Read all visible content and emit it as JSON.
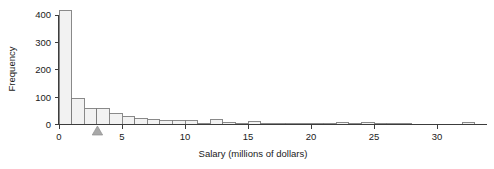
{
  "chart_data": {
    "type": "bar",
    "subtype": "histogram",
    "title": "",
    "xlabel": "Salary (millions of dollars)",
    "ylabel": "Frequency",
    "xlim": [
      0,
      33.5
    ],
    "ylim": [
      0,
      420
    ],
    "grid": false,
    "legend": null,
    "bin_width": 1,
    "x_ticks": [
      0,
      5,
      10,
      15,
      20,
      25,
      30
    ],
    "x_tick_labels": [
      "0",
      "5",
      "10",
      "15",
      "20",
      "25",
      "30"
    ],
    "y_ticks": [
      0,
      100,
      200,
      300,
      400
    ],
    "y_tick_labels": [
      "0",
      "100",
      "200",
      "300",
      "400"
    ],
    "bin_starts": [
      0,
      1,
      2,
      3,
      4,
      5,
      6,
      7,
      8,
      9,
      10,
      11,
      12,
      13,
      14,
      15,
      16,
      17,
      18,
      19,
      20,
      21,
      22,
      23,
      24,
      25,
      26,
      27,
      28,
      29,
      30,
      31,
      32
    ],
    "values": [
      415,
      95,
      60,
      60,
      40,
      30,
      22,
      20,
      13,
      13,
      13,
      5,
      19,
      7,
      5,
      10,
      5,
      3,
      5,
      3,
      2,
      1,
      7,
      2,
      8,
      1,
      1,
      1,
      0,
      0,
      0,
      0,
      6
    ],
    "categories": [
      "0-1",
      "1-2",
      "2-3",
      "3-4",
      "4-5",
      "5-6",
      "6-7",
      "7-8",
      "8-9",
      "9-10",
      "10-11",
      "11-12",
      "12-13",
      "13-14",
      "14-15",
      "15-16",
      "16-17",
      "17-18",
      "18-19",
      "19-20",
      "20-21",
      "21-22",
      "22-23",
      "23-24",
      "24-25",
      "25-26",
      "26-27",
      "27-28",
      "28-29",
      "29-30",
      "30-31",
      "31-32",
      "32-33"
    ],
    "annotations": [
      {
        "name": "median-marker",
        "shape": "triangle",
        "x": 3.05,
        "label": ""
      }
    ],
    "colors": {
      "bar_fill": "#f2f2f2",
      "bar_stroke": "#7d7d7d",
      "axis": "#3c3c3c",
      "text": "#1a1a1a",
      "marker": "#a8a8a8",
      "background": "#ffffff"
    }
  }
}
